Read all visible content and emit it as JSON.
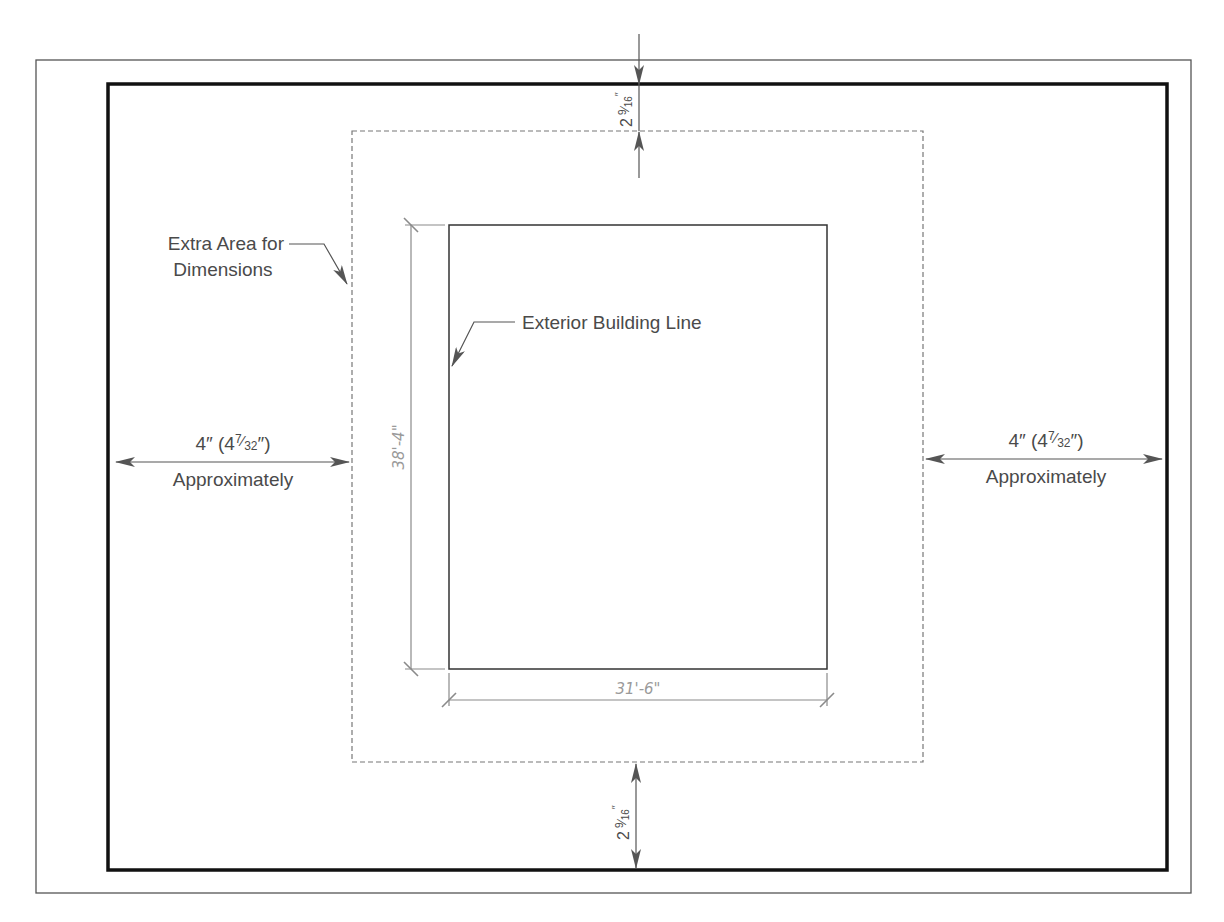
{
  "diagram": {
    "colors": {
      "frame": "#111111",
      "outer_frame": "#555555",
      "dashed": "#777777",
      "building": "#333333",
      "arrow": "#555555",
      "dimension_line": "#8a8a8a",
      "label": "#4a4a4a",
      "dimension_text": "#9a9a9a"
    },
    "labels": {
      "extra_area_line1": "Extra Area for",
      "extra_area_line2": "Dimensions",
      "exterior_building_line": "Exterior Building Line",
      "left_margin": {
        "whole": "4″ (4",
        "num": "7",
        "slash": "⁄",
        "den": "32",
        "close": "″)",
        "sub": "Approximately"
      },
      "right_margin": {
        "whole": "4″ (4",
        "num": "7",
        "slash": "⁄",
        "den": "32",
        "close": "″)",
        "sub": "Approximately"
      },
      "top_margin": {
        "whole": "2",
        "num": "9",
        "slash": "⁄",
        "den": "16",
        "inch": "″"
      },
      "bottom_margin": {
        "whole": "2",
        "num": "9",
        "slash": "⁄",
        "den": "16",
        "inch": "″"
      }
    },
    "dimensions": {
      "building_height": "38'-4\"",
      "building_width": "31'-6\""
    }
  }
}
